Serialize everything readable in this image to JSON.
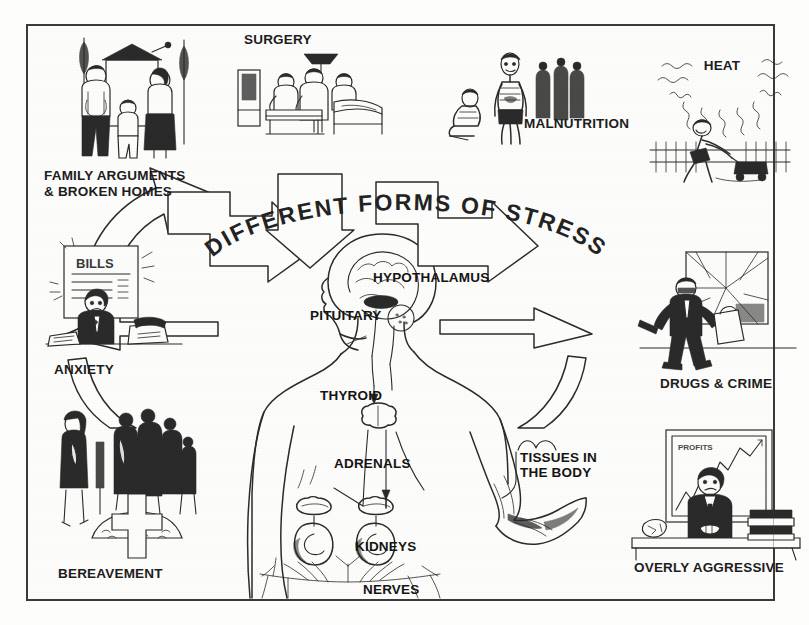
{
  "figure": {
    "title": "DIFFERENT FORMS OF STRESS",
    "kind": "educational-diagram"
  },
  "stressors": [
    {
      "id": "family",
      "label": "FAMILY ARGUMENTS\n& BROKEN HOMES",
      "icon": "family-argument-icon"
    },
    {
      "id": "surgery",
      "label": "SURGERY",
      "icon": "surgery-operating-table-icon"
    },
    {
      "id": "malnutrition",
      "label": "MALNUTRITION",
      "icon": "malnourished-person-icon"
    },
    {
      "id": "heat",
      "label": "HEAT",
      "icon": "sun-heat-rays-icon"
    },
    {
      "id": "anxiety",
      "label": "ANXIETY",
      "icon": "worried-person-bills-icon"
    },
    {
      "id": "drugs-crime",
      "label": "DRUGS & CRIME",
      "icon": "burglar-broken-window-icon"
    },
    {
      "id": "bereavement",
      "label": "BEREAVEMENT",
      "icon": "mourners-grave-cross-icon"
    },
    {
      "id": "overly-aggressive",
      "label": "OVERLY AGGRESSIVE",
      "icon": "executive-desk-chart-icon"
    }
  ],
  "anatomy": [
    {
      "id": "hypothalamus",
      "label": "HYPOTHALAMUS"
    },
    {
      "id": "pituitary",
      "label": "PITUITARY"
    },
    {
      "id": "thyroid",
      "label": "THYROID"
    },
    {
      "id": "adrenals",
      "label": "ADRENALS"
    },
    {
      "id": "kidneys",
      "label": "KIDNEYS"
    },
    {
      "id": "nerves",
      "label": "NERVES"
    },
    {
      "id": "tissues",
      "label": "TISSUES IN\nTHE BODY"
    }
  ],
  "incoming_arrow_count": 8,
  "colors": {
    "ink": "#2b2b2b",
    "paper": "#fcfcfa",
    "frame": "#3a3a38",
    "caption": "#1d1d1d"
  },
  "inline_art_text": {
    "anxiety_poster": "BILLS",
    "aggressive_chart": "PROFITS"
  }
}
